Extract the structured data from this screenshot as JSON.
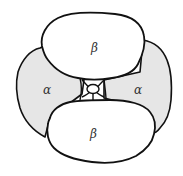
{
  "diagram": {
    "subunits": [
      {
        "id": "beta-top",
        "label": "β",
        "type": "beta",
        "fill": "#ffffff"
      },
      {
        "id": "beta-bottom",
        "label": "β",
        "type": "beta",
        "fill": "#ffffff"
      },
      {
        "id": "alpha-left",
        "label": "α",
        "type": "alpha",
        "fill": "#e6e6e6"
      },
      {
        "id": "alpha-right",
        "label": "α",
        "type": "alpha",
        "fill": "#e6e6e6"
      }
    ],
    "central_cavity": {
      "present": true
    },
    "colors": {
      "outline": "#111111",
      "alpha_fill": "#e6e6e6",
      "beta_fill": "#ffffff",
      "background": "#ffffff"
    }
  }
}
